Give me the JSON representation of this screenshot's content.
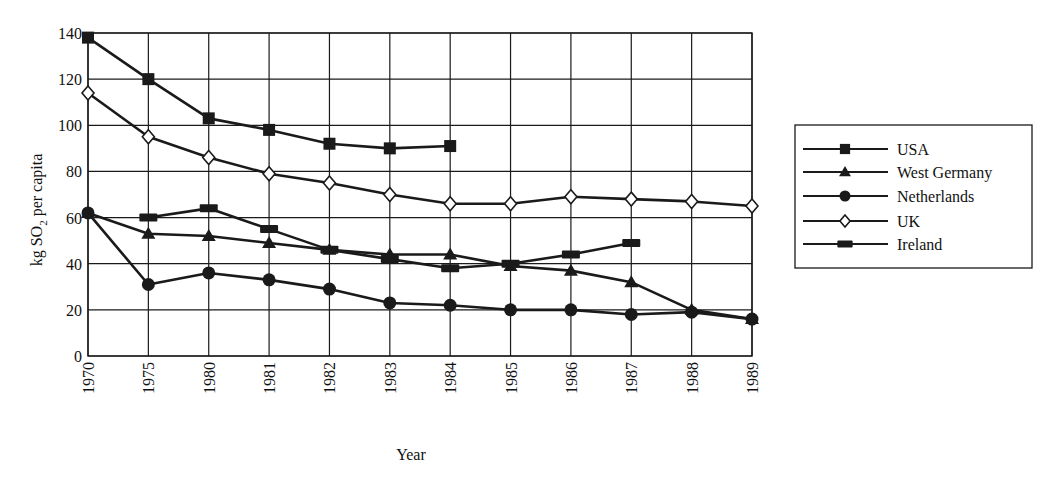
{
  "chart_data": {
    "type": "line",
    "title": "",
    "xlabel": "Year",
    "ylabel": "kg SO2 per capita",
    "ylabel_parts": {
      "pre": "kg SO",
      "sub": "2",
      "post": " per capita"
    },
    "ylim": [
      0,
      140
    ],
    "yticks": [
      0,
      20,
      40,
      60,
      80,
      100,
      120,
      140
    ],
    "grid": true,
    "legend_position": "right",
    "categories": [
      "1970",
      "1975",
      "1980",
      "1981",
      "1982",
      "1983",
      "1984",
      "1985",
      "1986",
      "1987",
      "1988",
      "1989"
    ],
    "series": [
      {
        "name": "USA",
        "marker": "square",
        "values": [
          138,
          120,
          103,
          98,
          92,
          90,
          91,
          null,
          null,
          null,
          null,
          null
        ]
      },
      {
        "name": "West Germany",
        "marker": "triangle",
        "values": [
          62,
          53,
          52,
          49,
          46,
          44,
          44,
          39,
          37,
          32,
          20,
          16
        ]
      },
      {
        "name": "Netherlands",
        "marker": "circle",
        "values": [
          62,
          31,
          36,
          33,
          29,
          23,
          22,
          20,
          20,
          18,
          19,
          16
        ]
      },
      {
        "name": "UK",
        "marker": "diamond-open",
        "values": [
          114,
          95,
          86,
          79,
          75,
          70,
          66,
          66,
          69,
          68,
          67,
          65
        ]
      },
      {
        "name": "Ireland",
        "marker": "bar",
        "values": [
          null,
          60,
          64,
          55,
          46,
          42,
          38,
          40,
          44,
          49,
          null,
          null
        ]
      }
    ]
  },
  "colors": {
    "line": "#1a1a1a",
    "grid": "#1a1a1a",
    "background": "#ffffff"
  }
}
